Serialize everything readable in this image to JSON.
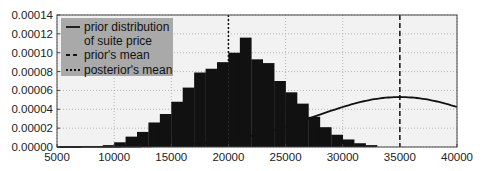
{
  "chart_data": {
    "type": "bar",
    "title": "",
    "xlabel": "",
    "ylabel": "",
    "xlim": [
      5000,
      40000
    ],
    "ylim": [
      0,
      0.00014
    ],
    "grid": true,
    "legend_position": "upper left",
    "x_ticks": [
      "5000",
      "10000",
      "15000",
      "20000",
      "25000",
      "30000",
      "35000",
      "40000"
    ],
    "x_tick_values": [
      5000,
      10000,
      15000,
      20000,
      25000,
      30000,
      35000,
      40000
    ],
    "y_ticks": [
      "0.00000",
      "0.00002",
      "0.00004",
      "0.00006",
      "0.00008",
      "0.00010",
      "0.00012",
      "0.00014"
    ],
    "y_tick_values": [
      0,
      2e-05,
      4e-05,
      6e-05,
      8e-05,
      0.0001,
      0.00012,
      0.00014
    ],
    "histogram": {
      "name": "posterior samples",
      "bin_width": 1000,
      "bin_starts": [
        8000,
        9000,
        10000,
        11000,
        12000,
        13000,
        14000,
        15000,
        16000,
        17000,
        18000,
        19000,
        20000,
        21000,
        22000,
        23000,
        24000,
        25000,
        26000,
        27000,
        28000,
        29000,
        30000,
        31000,
        32000
      ],
      "values": [
        1e-06,
        2e-06,
        5e-06,
        1.1e-05,
        1.6e-05,
        2.6e-05,
        3.5e-05,
        4.8e-05,
        6.3e-05,
        7.9e-05,
        8.3e-05,
        9e-05,
        0.0001,
        0.000116,
        9.3e-05,
        8.9e-05,
        7e-05,
        5.8e-05,
        4.6e-05,
        3.2e-05,
        2.1e-05,
        1.3e-05,
        8e-06,
        4e-06,
        2e-06
      ],
      "color": "#111111"
    },
    "series": [
      {
        "name": "prior distribution of suite price",
        "type": "line",
        "style": "solid",
        "distribution": "normal",
        "mean": 35000,
        "std": 7500,
        "peak_value": 5.3e-05
      }
    ],
    "vlines": [
      {
        "name": "prior's mean",
        "x": 35000,
        "style": "dashed"
      },
      {
        "name": "posterior's mean",
        "x": 20000,
        "style": "dotted"
      }
    ],
    "legend": [
      {
        "label": "prior distribution",
        "label2": "of suite price",
        "style": "solid"
      },
      {
        "label": "prior's mean",
        "style": "dashed"
      },
      {
        "label": "posterior's mean",
        "style": "dotted"
      }
    ],
    "colors": {
      "plot_bg": "#f2f2f2",
      "grid": "#9a9a9a",
      "bars": "#111111",
      "line": "#111111",
      "legend_bg": "#a9a9a9"
    }
  }
}
